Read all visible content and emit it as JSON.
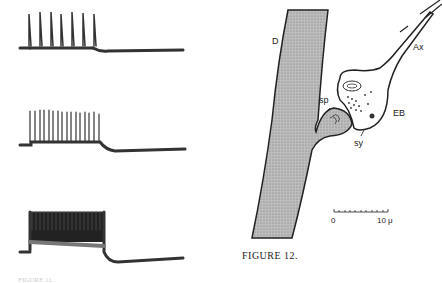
{
  "figure": {
    "caption": "FIGURE 12.",
    "caption_left_fragment": "FIGURE 11.",
    "traces": [
      {
        "name": "trace-1",
        "spike_count": 7
      },
      {
        "name": "trace-2",
        "spike_count": 16
      },
      {
        "name": "trace-3",
        "spike_count": 20
      }
    ],
    "diagram_labels": {
      "dendrite": "D",
      "axon": "Ax",
      "end_bulb": "EB",
      "spine": "sp",
      "synapse": "sy"
    },
    "scale_bar": {
      "min": "0",
      "max": "10 μ"
    }
  }
}
